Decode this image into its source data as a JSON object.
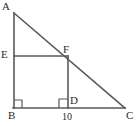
{
  "figure": {
    "type": "geometry-diagram",
    "stroke_color": "#595959",
    "background_color": "#ffffff",
    "label_color": "#2b2b2b",
    "width": 138,
    "height": 126,
    "vertices": [
      {
        "name": "A",
        "label": "A",
        "x": 14,
        "y": 13,
        "label_x": 2,
        "label_y": 1
      },
      {
        "name": "E",
        "label": "E",
        "x": 14,
        "y": 56,
        "label_x": 1,
        "label_y": 49
      },
      {
        "name": "F",
        "label": "F",
        "x": 68,
        "y": 56,
        "label_x": 63,
        "label_y": 44
      },
      {
        "name": "B",
        "label": "B",
        "x": 14,
        "y": 108,
        "label_x": 8,
        "label_y": 110
      },
      {
        "name": "D",
        "label": "D",
        "x": 68,
        "y": 108,
        "label_x": 70,
        "label_y": 95
      },
      {
        "name": "C",
        "label": "C",
        "x": 125,
        "y": 108,
        "label_x": 126,
        "label_y": 110
      }
    ],
    "segments": [
      {
        "name": "segment-AB",
        "from": "A",
        "to": "B",
        "x1": 14,
        "y1": 13,
        "x2": 14,
        "y2": 108
      },
      {
        "name": "segment-AC",
        "from": "A",
        "to": "C",
        "x1": 14,
        "y1": 13,
        "x2": 125,
        "y2": 108
      },
      {
        "name": "segment-BC",
        "from": "B",
        "to": "C",
        "x1": 14,
        "y1": 108,
        "x2": 125,
        "y2": 108
      },
      {
        "name": "segment-EF",
        "from": "E",
        "to": "F",
        "x1": 14,
        "y1": 56,
        "x2": 68,
        "y2": 56
      },
      {
        "name": "segment-FD",
        "from": "F",
        "to": "D",
        "x1": 68,
        "y1": 56,
        "x2": 68,
        "y2": 108
      }
    ],
    "right_angle_marks": [
      {
        "name": "right-angle-at-B",
        "vertex": "B",
        "points": "14,100 22,100 22,108"
      },
      {
        "name": "right-angle-at-D",
        "vertex": "D",
        "points": "68,99 59,99 59,108"
      }
    ],
    "measures": [
      {
        "name": "measure-BD",
        "value": "10",
        "segment": "B-D",
        "label_x": 62,
        "label_y": 112
      }
    ]
  }
}
